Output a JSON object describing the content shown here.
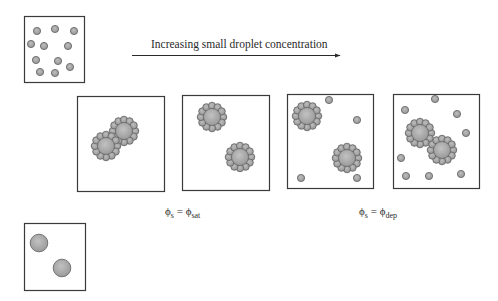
{
  "figure": {
    "arrow_label": "Increasing small droplet concentration",
    "colors": {
      "droplet_fill": "#a8a8a8",
      "droplet_stroke": "#6a6a6a",
      "big_fill": "#ababab",
      "box_stroke": "#3a3a3a",
      "text": "#2a2a2a"
    },
    "labels": {
      "saturation": {
        "phi": "ϕ",
        "lhs_sub": "s",
        "equals": " = ",
        "rhs_phi": "ϕ",
        "rhs_sub": "sat"
      },
      "depletion": {
        "phi": "ϕ",
        "lhs_sub": "s",
        "equals": " = ",
        "rhs_phi": "ϕ",
        "rhs_sub": "dep"
      }
    },
    "boxes": [
      {
        "id": "small-droplets-reference",
        "x": 24,
        "y": 16,
        "w": 60,
        "h": 66
      },
      {
        "id": "panel-1-bridging-flocculation",
        "x": 77,
        "y": 96,
        "w": 87,
        "h": 95
      },
      {
        "id": "panel-2-saturated",
        "x": 182,
        "y": 95,
        "w": 87,
        "h": 95
      },
      {
        "id": "panel-3-excess-small-droplets",
        "x": 287,
        "y": 94,
        "w": 86,
        "h": 94
      },
      {
        "id": "panel-4-depletion-flocculation",
        "x": 393,
        "y": 94,
        "w": 86,
        "h": 94
      },
      {
        "id": "large-droplets-reference",
        "x": 24,
        "y": 223,
        "w": 61,
        "h": 67
      }
    ],
    "small_free_droplets": {
      "small-droplets-reference": [
        [
          37,
          31
        ],
        [
          55,
          29
        ],
        [
          74,
          31
        ],
        [
          31,
          44
        ],
        [
          44,
          46
        ],
        [
          68,
          46
        ],
        [
          36,
          60
        ],
        [
          58,
          61
        ],
        [
          70,
          67
        ],
        [
          40,
          72
        ],
        [
          55,
          73
        ]
      ],
      "panel-3-excess-small-droplets": [
        [
          329,
          100
        ],
        [
          357,
          120
        ],
        [
          301,
          178
        ],
        [
          357,
          178
        ]
      ],
      "panel-4-depletion-flocculation": [
        [
          435,
          99
        ],
        [
          405,
          110
        ],
        [
          457,
          114
        ],
        [
          466,
          133
        ],
        [
          401,
          158
        ],
        [
          406,
          176
        ],
        [
          429,
          176
        ],
        [
          461,
          174
        ]
      ]
    },
    "clusters": {
      "panel-1-bridging-flocculation": [
        [
          124,
          131
        ],
        [
          106,
          146
        ]
      ],
      "panel-2-saturated": [
        [
          212,
          117
        ],
        [
          240,
          157
        ]
      ],
      "panel-3-excess-small-droplets": [
        [
          307,
          116
        ],
        [
          347,
          158
        ]
      ],
      "panel-4-depletion-flocculation": [
        [
          420,
          133
        ],
        [
          442,
          150
        ]
      ]
    },
    "large_droplets": {
      "large-droplets-reference": [
        [
          39,
          243
        ],
        [
          62,
          268
        ]
      ]
    }
  }
}
